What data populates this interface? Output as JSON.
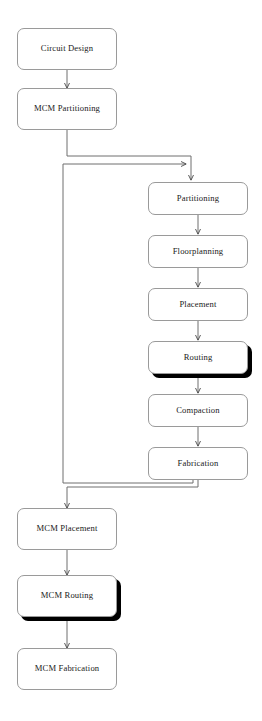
{
  "diagram": {
    "style": {
      "box_fill": "#ffffff",
      "box_stroke": "#9a9a9a",
      "line_stroke": "#5a5a5a",
      "shadow_color": "#000000",
      "text_color": "#1a1a1a",
      "background": "#ffffff"
    },
    "nodes": [
      {
        "id": "circuit_design",
        "label": "Circuit Design",
        "column": "outer",
        "shadowed": false
      },
      {
        "id": "mcm_partitioning",
        "label": "MCM Partitioning",
        "column": "outer",
        "shadowed": false
      },
      {
        "id": "partitioning",
        "label": "Partitioning",
        "column": "inner",
        "shadowed": false
      },
      {
        "id": "floorplanning",
        "label": "Floorplanning",
        "column": "inner",
        "shadowed": false
      },
      {
        "id": "placement",
        "label": "Placement",
        "column": "inner",
        "shadowed": false
      },
      {
        "id": "routing",
        "label": "Routing",
        "column": "inner",
        "shadowed": true
      },
      {
        "id": "compaction",
        "label": "Compaction",
        "column": "inner",
        "shadowed": false
      },
      {
        "id": "fabrication",
        "label": "Fabrication",
        "column": "inner",
        "shadowed": false
      },
      {
        "id": "mcm_placement",
        "label": "MCM Placement",
        "column": "outer",
        "shadowed": false
      },
      {
        "id": "mcm_routing",
        "label": "MCM Routing",
        "column": "outer",
        "shadowed": true
      },
      {
        "id": "mcm_fabrication",
        "label": "MCM Fabrication",
        "column": "outer",
        "shadowed": false
      }
    ],
    "edges": [
      {
        "from": "circuit_design",
        "to": "mcm_partitioning",
        "kind": "straight-down"
      },
      {
        "from": "mcm_partitioning",
        "to": "partitioning",
        "kind": "right-then-down"
      },
      {
        "from": "partitioning",
        "to": "floorplanning",
        "kind": "straight-down"
      },
      {
        "from": "floorplanning",
        "to": "placement",
        "kind": "straight-down"
      },
      {
        "from": "placement",
        "to": "routing",
        "kind": "straight-down"
      },
      {
        "from": "routing",
        "to": "compaction",
        "kind": "straight-down"
      },
      {
        "from": "compaction",
        "to": "fabrication",
        "kind": "straight-down"
      },
      {
        "from": "fabrication",
        "to": "mcm_placement",
        "kind": "down-left-then-down"
      },
      {
        "from": "fabrication",
        "to": "partitioning",
        "kind": "feedback-loop-left"
      },
      {
        "from": "mcm_placement",
        "to": "mcm_routing",
        "kind": "straight-down"
      },
      {
        "from": "mcm_routing",
        "to": "mcm_fabrication",
        "kind": "straight-down"
      }
    ]
  }
}
